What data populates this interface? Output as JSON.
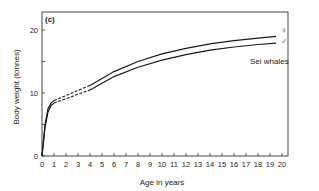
{
  "panel_label": "(c)",
  "annotation": "Sei whales",
  "legend": {
    "female_symbol": "♀",
    "male_symbol": "♂"
  },
  "colors": {
    "line": "#1a1a1a",
    "axis": "#333333",
    "background": "#ffffff"
  },
  "chart_data": {
    "type": "line",
    "title": "",
    "panel": "(c)",
    "xlabel": "Age in years",
    "ylabel": "Body weight (tonnes)",
    "xlim": [
      0,
      20
    ],
    "ylim": [
      0,
      23
    ],
    "x_ticks": [
      0,
      1,
      2,
      3,
      4,
      5,
      6,
      7,
      8,
      9,
      10,
      11,
      12,
      13,
      14,
      15,
      16,
      17,
      18,
      19,
      20
    ],
    "y_ticks": [
      0,
      10,
      20
    ],
    "y_minor_ticks": [
      5,
      15
    ],
    "grid": false,
    "legend_position": "right end of curves (symbols)",
    "annotations": [
      {
        "text": "Sei whales",
        "x": 17.5,
        "y": 15.5
      },
      {
        "text": "♀",
        "x": 19.6,
        "y": 20.0
      },
      {
        "text": "♂",
        "x": 19.6,
        "y": 18.6
      }
    ],
    "dashed_segment_x": [
      1,
      4
    ],
    "series": [
      {
        "name": "Female (♀)",
        "x": [
          0,
          0.25,
          0.5,
          0.75,
          1,
          2,
          3,
          4,
          6,
          8,
          10,
          12,
          14,
          16,
          18,
          19.5
        ],
        "y": [
          0,
          5.0,
          7.5,
          8.4,
          8.8,
          9.6,
          10.4,
          11.2,
          13.4,
          15.0,
          16.2,
          17.1,
          17.8,
          18.3,
          18.7,
          19.0
        ]
      },
      {
        "name": "Male (♂)",
        "x": [
          0,
          0.25,
          0.5,
          0.75,
          1,
          2,
          3,
          4,
          6,
          8,
          10,
          12,
          14,
          16,
          18,
          19.5
        ],
        "y": [
          0,
          4.5,
          7.0,
          8.0,
          8.4,
          9.1,
          9.8,
          10.5,
          12.6,
          14.1,
          15.2,
          16.1,
          16.8,
          17.3,
          17.7,
          17.9
        ]
      }
    ]
  }
}
